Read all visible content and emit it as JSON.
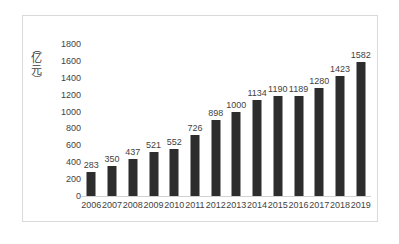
{
  "chart_data": {
    "type": "bar",
    "title": "",
    "subtitle": "",
    "xlabel": "",
    "ylabel": "（亿元）",
    "ylabel_parts": {
      "open_paren": "（",
      "char1": "亿",
      "char2": "元",
      "close_paren": "）"
    },
    "categories": [
      "2006",
      "2007",
      "2008",
      "2009",
      "2010",
      "2011",
      "2012",
      "2013",
      "2014",
      "2015",
      "2016",
      "2017",
      "2018",
      "2019"
    ],
    "values": [
      283,
      350,
      437,
      521,
      552,
      726,
      898,
      1000,
      1134,
      1190,
      1189,
      1280,
      1423,
      1582
    ],
    "value_labels": [
      "283",
      "350",
      "437",
      "521",
      "552",
      "726",
      "898",
      "1000",
      "1134",
      "1190",
      "1189",
      "1280",
      "1423",
      "1582"
    ],
    "ylim": [
      0,
      1800
    ],
    "ytick_values": [
      0,
      200,
      400,
      600,
      800,
      1000,
      1200,
      1400,
      1600,
      1800
    ],
    "ytick_labels": [
      "0",
      "200",
      "400",
      "600",
      "800",
      "1000",
      "1200",
      "1400",
      "1600",
      "1800"
    ],
    "grid": false,
    "legend": false,
    "legend_position": "none",
    "series": [
      {
        "name": "",
        "color": "#2d2d2d",
        "values": [
          283,
          350,
          437,
          521,
          552,
          726,
          898,
          1000,
          1134,
          1190,
          1189,
          1280,
          1423,
          1582
        ]
      }
    ]
  },
  "style": {
    "bar_color": "#2d2d2d",
    "text_color": "#3f3f3f",
    "frame_color": "#d9d9d9",
    "axis_color": "#d2d2d2",
    "background": "#ffffff"
  }
}
